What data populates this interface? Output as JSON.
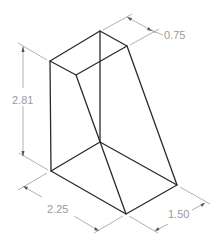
{
  "figure": {
    "type": "isometric-technical-drawing",
    "object": "tapered-block",
    "colors": {
      "object_lines": "#2a2a2a",
      "dimension_lines": "#a8a8a8",
      "dimension_text": "#9a9a9a",
      "background": "#ffffff"
    }
  },
  "dimensions": {
    "height": {
      "label": "2.81"
    },
    "top_depth": {
      "label": "0.75"
    },
    "base_width": {
      "label": "2.25"
    },
    "base_depth": {
      "label": "1.50"
    }
  }
}
